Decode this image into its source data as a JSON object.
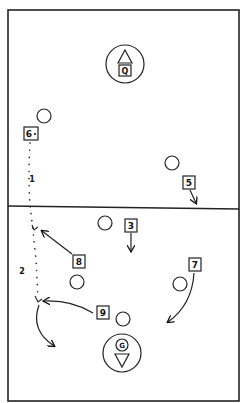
{
  "diagram": {
    "type": "play-diagram",
    "sport": "ice hockey / water polo style rink diagram",
    "colors": {
      "ink": "#111111",
      "paper": "#ffffff"
    },
    "field": {
      "border": {
        "x": 8,
        "y": 10,
        "width": 231,
        "height": 391
      },
      "center_line_y": 206
    },
    "goalies": [
      {
        "id": "goalie-top",
        "label": "Q",
        "cx": 125,
        "cy": 64,
        "r": 19,
        "triangle": "up"
      },
      {
        "id": "goalie-bottom",
        "label": "G",
        "cx": 122,
        "cy": 353,
        "r": 19,
        "triangle": "down"
      }
    ],
    "players": [
      {
        "id": "player-6",
        "label": "6",
        "suffix": "•",
        "x": 31,
        "y": 134
      },
      {
        "id": "player-5",
        "label": "5",
        "x": 189,
        "y": 182
      },
      {
        "id": "player-3",
        "label": "3",
        "x": 131,
        "y": 226
      },
      {
        "id": "player-8",
        "label": "8",
        "x": 79,
        "y": 262
      },
      {
        "id": "player-7",
        "label": "7",
        "x": 195,
        "y": 265
      },
      {
        "id": "player-9",
        "label": "9",
        "x": 103,
        "y": 313
      }
    ],
    "opponents": [
      {
        "id": "opponent-1",
        "cx": 44,
        "cy": 116,
        "r": 7
      },
      {
        "id": "opponent-2",
        "cx": 172,
        "cy": 163,
        "r": 7
      },
      {
        "id": "opponent-3",
        "cx": 105,
        "cy": 223,
        "r": 7
      },
      {
        "id": "opponent-4",
        "cx": 77,
        "cy": 282,
        "r": 7
      },
      {
        "id": "opponent-5",
        "cx": 180,
        "cy": 284,
        "r": 7
      },
      {
        "id": "opponent-6",
        "cx": 123,
        "cy": 319,
        "r": 7
      }
    ],
    "pass_labels": [
      {
        "id": "pass-1-label",
        "text": "1",
        "x": 32,
        "y": 181
      },
      {
        "id": "pass-2-label",
        "text": "2",
        "x": 22,
        "y": 273
      }
    ],
    "movements": [
      {
        "id": "move-5",
        "from": "player-5",
        "desc": "short diagonal to center line"
      },
      {
        "id": "move-3",
        "from": "player-3",
        "desc": "straight down"
      },
      {
        "id": "move-8",
        "from": "player-8",
        "desc": "diagonal up-left to dotted path"
      },
      {
        "id": "move-7",
        "from": "player-7",
        "desc": "curved down-left"
      },
      {
        "id": "move-9",
        "from": "player-9",
        "desc": "curved left to dotted path"
      },
      {
        "id": "move-shot",
        "from": "dotted-path-end",
        "desc": "curve down-right"
      }
    ]
  }
}
